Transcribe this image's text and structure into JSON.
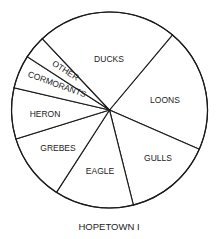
{
  "chart_data": {
    "type": "pie",
    "title": "HOPETOWN I",
    "start_angle_deg": 40,
    "direction": "clockwise",
    "center": [
      109.5,
      110
    ],
    "radius": 98,
    "colors": {
      "fill": "#ffffff",
      "stroke": "#1a1a1a",
      "text": "#222222"
    },
    "slices": [
      {
        "label": "LOONS",
        "value": 20.4,
        "label_pos": [
          165,
          103
        ],
        "rotate": 0
      },
      {
        "label": "GULLS",
        "value": 14.5,
        "label_pos": [
          158,
          161
        ],
        "rotate": 0
      },
      {
        "label": "EAGLE",
        "value": 13.0,
        "label_pos": [
          100,
          174
        ],
        "rotate": 0
      },
      {
        "label": "GREBES",
        "value": 11.1,
        "label_pos": [
          58,
          151
        ],
        "rotate": 0
      },
      {
        "label": "HERON",
        "value": 8.4,
        "label_pos": [
          45,
          117
        ],
        "rotate": 0
      },
      {
        "label": "CORMORANTS",
        "value": 5.5,
        "label_pos": [
          56,
          87
        ],
        "rotate": 20
      },
      {
        "label": "OTHER",
        "value": 3.8,
        "label_pos": [
          64,
          73
        ],
        "rotate": 32
      },
      {
        "label": "DUCKS",
        "value": 23.1,
        "label_pos": [
          109,
          62
        ],
        "rotate": 0
      }
    ],
    "caption_pos": [
      109,
      230
    ]
  }
}
